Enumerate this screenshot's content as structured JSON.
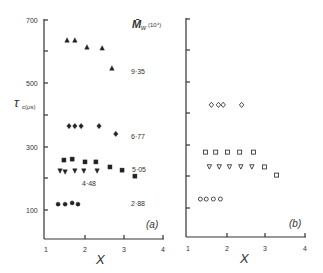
{
  "chart_data": [
    {
      "panel": "a",
      "type": "scatter",
      "panel_label": "(a)",
      "xlabel": "X",
      "ylabel": "τc(μs)",
      "xlim": [
        1,
        4
      ],
      "ylim": [
        0,
        700
      ],
      "xticks": [
        1,
        2,
        3,
        4
      ],
      "yticks": [
        100,
        200,
        300,
        400,
        500,
        600,
        700
      ],
      "ytick_labels": [
        "100",
        "",
        "300",
        "",
        "500",
        "",
        "700"
      ],
      "legend_title": "M̄w (10⁴)",
      "grid": false,
      "series": [
        {
          "name": "9·35",
          "marker": "triangle-up-filled",
          "x": [
            1.54,
            1.74,
            2.05,
            2.44,
            2.69
          ],
          "y": [
            638,
            638,
            616,
            613,
            549
          ]
        },
        {
          "name": "6·77",
          "marker": "diamond-filled",
          "x": [
            1.59,
            1.74,
            1.9,
            2.36,
            2.79
          ],
          "y": [
            365,
            365,
            365,
            365,
            340
          ]
        },
        {
          "name": "5·05",
          "marker": "square-filled",
          "x": [
            1.46,
            1.67,
            2.0,
            2.28,
            2.64,
            2.95,
            3.28
          ],
          "y": [
            257,
            260,
            251,
            251,
            235,
            225,
            206
          ]
        },
        {
          "name": "4·48",
          "marker": "triangle-down-filled",
          "x": [
            1.36,
            1.49,
            1.74,
            1.97,
            2.31
          ],
          "y": [
            222,
            219,
            222,
            222,
            222
          ]
        },
        {
          "name": "2·88",
          "marker": "circle-filled",
          "x": [
            1.31,
            1.49,
            1.67,
            1.82
          ],
          "y": [
            117,
            117,
            121,
            117
          ]
        }
      ]
    },
    {
      "panel": "b",
      "type": "scatter",
      "panel_label": "(b)",
      "xlabel": "X",
      "ylabel": "",
      "xlim": [
        1,
        4
      ],
      "ylim": [
        0,
        700
      ],
      "xticks": [
        1,
        2,
        3,
        4
      ],
      "yticks": [
        100,
        200,
        300,
        400,
        500,
        600,
        700
      ],
      "grid": false,
      "series": [
        {
          "name": "6·77",
          "marker": "diamond-open",
          "x": [
            1.62,
            1.8,
            1.92,
            2.39
          ],
          "y": [
            429,
            429,
            429,
            429
          ]
        },
        {
          "name": "5·05",
          "marker": "square-open",
          "x": [
            1.47,
            1.73,
            2.03,
            2.34,
            2.69,
            2.97,
            3.28
          ],
          "y": [
            279,
            279,
            279,
            279,
            279,
            232,
            206
          ]
        },
        {
          "name": "4·48",
          "marker": "triangle-down-open",
          "x": [
            1.57,
            1.82,
            2.08,
            2.37,
            2.65
          ],
          "y": [
            232,
            232,
            232,
            232,
            232
          ]
        },
        {
          "name": "2·88",
          "marker": "circle-open",
          "x": [
            1.34,
            1.49,
            1.67,
            1.85
          ],
          "y": [
            130,
            130,
            130,
            130
          ]
        }
      ]
    }
  ],
  "labels": {
    "legend_title_main": "M̄",
    "legend_title_sub": "w",
    "legend_title_unit": "(10⁴)",
    "ylabel_main": "τ",
    "ylabel_sub": "c(μs)",
    "series_labels": [
      "9·35",
      "6·77",
      "5·05",
      "4·48",
      "2·88"
    ],
    "panel_a": "(a)",
    "panel_b": "(b)",
    "xlabel": "X",
    "xtick_labels": [
      "1",
      "2",
      "3",
      "4"
    ],
    "ytick_labels": [
      "700",
      "500",
      "300",
      "100"
    ]
  }
}
